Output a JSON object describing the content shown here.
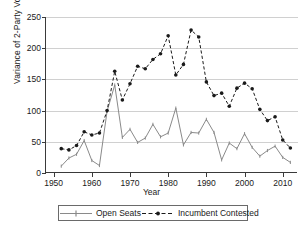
{
  "chart_data": {
    "type": "line",
    "title": "",
    "xlabel": "Year",
    "ylabel": "Variance of 2-Party Vote",
    "xlim": [
      1948,
      2014
    ],
    "ylim": [
      0,
      250
    ],
    "xticks": [
      1950,
      1960,
      1970,
      1980,
      1990,
      2000,
      2010
    ],
    "yticks": [
      0,
      50,
      100,
      150,
      200,
      250
    ],
    "grid": "horizontal",
    "legend_position": "bottom",
    "x": [
      1952,
      1954,
      1956,
      1958,
      1960,
      1962,
      1964,
      1966,
      1968,
      1970,
      1972,
      1974,
      1976,
      1978,
      1980,
      1982,
      1984,
      1986,
      1988,
      1990,
      1992,
      1994,
      1996,
      1998,
      2000,
      2002,
      2004,
      2006,
      2008,
      2010,
      2012
    ],
    "series": [
      {
        "name": "Open Seats",
        "style": "solid",
        "marker": "tick",
        "color": "#8a8a8a",
        "values": [
          11,
          24,
          30,
          52,
          20,
          12,
          99,
          141,
          57,
          70,
          49,
          56,
          78,
          58,
          64,
          104,
          45,
          65,
          64,
          86,
          65,
          21,
          48,
          39,
          63,
          41,
          27,
          36,
          43,
          25,
          17
        ]
      },
      {
        "name": "Incumbent Contested",
        "style": "dashed",
        "marker": "circle",
        "color": "#1a1a1a",
        "values": [
          39,
          37,
          44,
          66,
          61,
          64,
          100,
          163,
          117,
          143,
          171,
          167,
          182,
          191,
          220,
          157,
          174,
          229,
          218,
          146,
          124,
          128,
          107,
          136,
          144,
          135,
          102,
          84,
          90,
          53,
          40
        ]
      }
    ]
  },
  "legend": {
    "items": [
      {
        "label": "Open Seats"
      },
      {
        "label": "Incumbent Contested"
      }
    ]
  }
}
